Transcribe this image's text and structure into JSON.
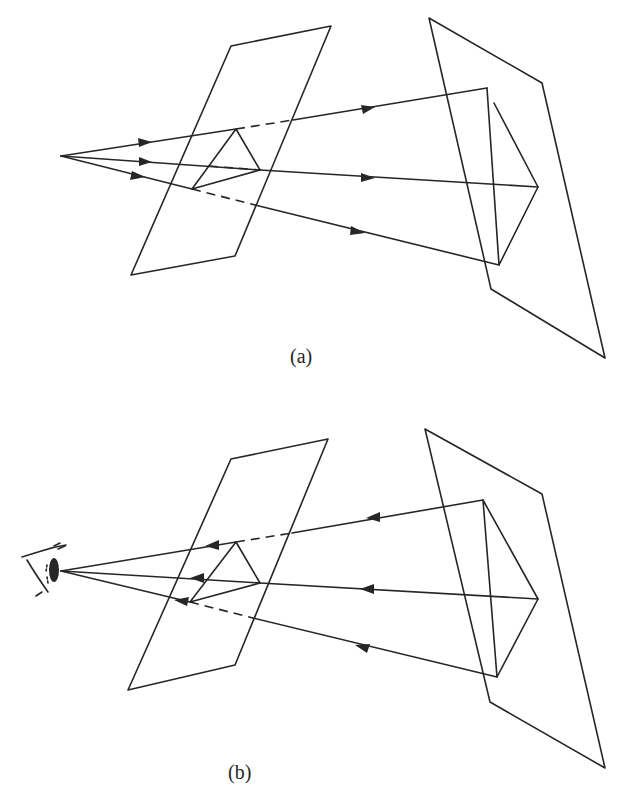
{
  "figure": {
    "panels": [
      {
        "id": "a",
        "caption": "(a)",
        "description": "Projection from a point source: rays travel from the center of projection through a triangle on the left (picture) plane to a triangle on the right (object) plane.",
        "ray_direction": "outward",
        "source": "point"
      },
      {
        "id": "b",
        "caption": "(b)",
        "description": "Viewing: rays travel from the triangle on the right plane back through the picture plane to the eye.",
        "ray_direction": "inward",
        "source": "eye"
      }
    ],
    "colors": {
      "line": "#262626",
      "background": "#ffffff"
    }
  }
}
